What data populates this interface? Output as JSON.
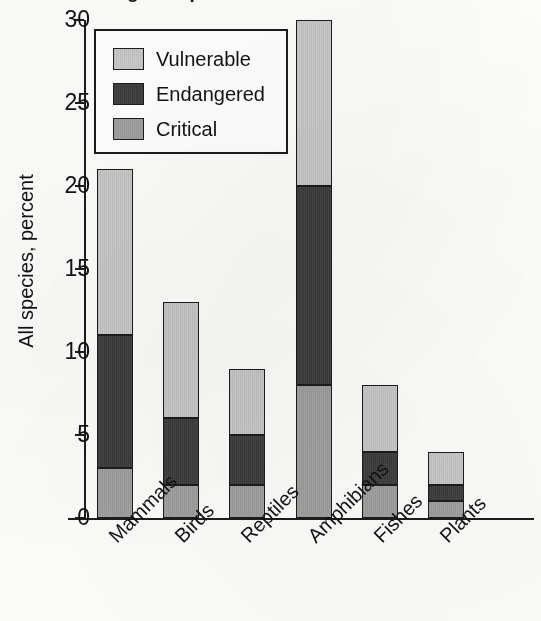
{
  "figure": {
    "title_cropped": "Percentage of species threatened with extinction",
    "background_color": "#fdfdfc",
    "ink_color": "#1d1d1d"
  },
  "legend": {
    "position": "top-left-inside-plot",
    "entries": [
      {
        "label": "Vulnerable",
        "color": "#c9c9c9"
      },
      {
        "label": "Endangered",
        "color": "#3d3d3d"
      },
      {
        "label": "Critical",
        "color": "#a0a0a0"
      }
    ]
  },
  "chart_data": {
    "type": "bar",
    "subtype": "stacked-vertical",
    "title": "",
    "xlabel": "",
    "ylabel": "All species, percent",
    "ylim": [
      0,
      30
    ],
    "ytick_values": [
      0,
      5,
      10,
      15,
      20,
      25,
      30
    ],
    "ytick_labels": [
      "0",
      "5",
      "10",
      "15",
      "20",
      "25",
      "30"
    ],
    "grid": false,
    "legend_position": "upper left",
    "categories": [
      "Mammals",
      "Birds",
      "Reptiles",
      "Amphibians",
      "Fishes",
      "Plants"
    ],
    "series": [
      {
        "name": "Critical",
        "color": "#a0a0a0",
        "values": [
          3,
          2,
          2,
          8,
          2,
          1
        ]
      },
      {
        "name": "Endangered",
        "color": "#3d3d3d",
        "values": [
          8,
          4,
          3,
          12,
          2,
          1
        ]
      },
      {
        "name": "Vulnerable",
        "color": "#c9c9c9",
        "values": [
          10,
          7,
          4,
          10,
          4,
          2
        ]
      }
    ],
    "stack_order_bottom_to_top": [
      "Critical",
      "Endangered",
      "Vulnerable"
    ],
    "totals": [
      21,
      13,
      9,
      30,
      8,
      4
    ]
  }
}
